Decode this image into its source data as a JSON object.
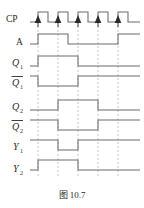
{
  "figure": {
    "caption": "图 10.7",
    "type": "digital-timing-diagram",
    "background": "#ffffff",
    "wave_color": "#6b6b6b",
    "dash_color": "#b4b4b4",
    "text_color": "#2b2b2b"
  },
  "axis": {
    "x_start": 30,
    "x_end": 140,
    "period": 20,
    "marker_count": 5,
    "marker_x": [
      38,
      58,
      78,
      98,
      118
    ],
    "note": "dashed vertical markers align with CP rising edges"
  },
  "signals": [
    {
      "name": "CP",
      "label": "CP",
      "overbar": false,
      "subscript": "",
      "row_y": 18,
      "kind": "clock",
      "pulses": [
        {
          "rise": 38,
          "fall": 48
        },
        {
          "rise": 58,
          "fall": 68
        },
        {
          "rise": 78,
          "fall": 88
        },
        {
          "rise": 98,
          "fall": 108
        },
        {
          "rise": 118,
          "fall": 128
        }
      ],
      "levels": "0 1 0 1 0 1 0 1 0 1 0"
    },
    {
      "name": "A",
      "label": "A",
      "overbar": false,
      "subscript": "",
      "row_y": 40,
      "kind": "data",
      "transitions": [
        {
          "x": 30,
          "level": 0
        },
        {
          "x": 38,
          "level": 1
        },
        {
          "x": 68,
          "level": 0
        },
        {
          "x": 118,
          "level": 1
        },
        {
          "x": 140,
          "level": 1
        }
      ]
    },
    {
      "name": "Q1",
      "label": "Q",
      "overbar": false,
      "subscript": "1",
      "row_y": 62,
      "kind": "data",
      "transitions": [
        {
          "x": 30,
          "level": 0
        },
        {
          "x": 38,
          "level": 1
        },
        {
          "x": 78,
          "level": 0
        },
        {
          "x": 140,
          "level": 0
        }
      ]
    },
    {
      "name": "Q1bar",
      "label": "Q",
      "overbar": true,
      "subscript": "1",
      "row_y": 82,
      "kind": "data",
      "transitions": [
        {
          "x": 30,
          "level": 1
        },
        {
          "x": 38,
          "level": 0
        },
        {
          "x": 78,
          "level": 1
        },
        {
          "x": 140,
          "level": 1
        }
      ]
    },
    {
      "name": "Q2",
      "label": "Q",
      "overbar": false,
      "subscript": "2",
      "row_y": 106,
      "kind": "data",
      "transitions": [
        {
          "x": 30,
          "level": 0
        },
        {
          "x": 58,
          "level": 1
        },
        {
          "x": 98,
          "level": 0
        },
        {
          "x": 140,
          "level": 0
        }
      ]
    },
    {
      "name": "Q2bar",
      "label": "Q",
      "overbar": true,
      "subscript": "2",
      "row_y": 126,
      "kind": "data",
      "transitions": [
        {
          "x": 30,
          "level": 1
        },
        {
          "x": 58,
          "level": 0
        },
        {
          "x": 98,
          "level": 1
        },
        {
          "x": 140,
          "level": 1
        }
      ]
    },
    {
      "name": "Y1",
      "label": "Y",
      "overbar": false,
      "subscript": "1",
      "row_y": 146,
      "kind": "data",
      "transitions": [
        {
          "x": 30,
          "level": 1
        },
        {
          "x": 58,
          "level": 0
        },
        {
          "x": 78,
          "level": 1
        },
        {
          "x": 140,
          "level": 1
        }
      ]
    },
    {
      "name": "Y2",
      "label": "Y",
      "overbar": false,
      "subscript": "2",
      "row_y": 166,
      "kind": "data",
      "transitions": [
        {
          "x": 30,
          "level": 0
        },
        {
          "x": 38,
          "level": 1
        },
        {
          "x": 78,
          "level": 0
        },
        {
          "x": 140,
          "level": 0
        }
      ]
    }
  ]
}
